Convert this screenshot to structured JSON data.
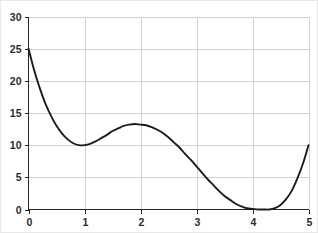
{
  "chart_data": {
    "type": "line",
    "title": "",
    "subtitle": "",
    "xlabel": "",
    "ylabel": "",
    "xlim": [
      0,
      5
    ],
    "ylim": [
      0,
      30
    ],
    "grid": true,
    "legend": null,
    "legend_position": "none",
    "xticks": [
      0,
      1,
      2,
      3,
      4,
      5
    ],
    "xtick_labels": [
      "0",
      "1",
      "2",
      "3",
      "4",
      "5"
    ],
    "yticks": [
      0,
      5,
      10,
      15,
      20,
      25,
      30
    ],
    "ytick_labels": [
      "0",
      "5",
      "10",
      "15",
      "20",
      "25",
      "30"
    ],
    "series": [
      {
        "name": "curve",
        "color": "#1c1c1c",
        "line_width": 1.9,
        "x": [
          0.0,
          0.1,
          0.2,
          0.3,
          0.4,
          0.5,
          0.6,
          0.7,
          0.8,
          0.9,
          1.0,
          1.1,
          1.2,
          1.3,
          1.4,
          1.5,
          1.6,
          1.7,
          1.8,
          1.9,
          2.0,
          2.1,
          2.2,
          2.3,
          2.4,
          2.5,
          2.6,
          2.7,
          2.8,
          2.9,
          3.0,
          3.1,
          3.2,
          3.3,
          3.4,
          3.5,
          3.6,
          3.7,
          3.8,
          3.9,
          4.0,
          4.1,
          4.2,
          4.3,
          4.4,
          4.5,
          4.6,
          4.7,
          4.8,
          4.9,
          5.0
        ],
        "y": [
          25.0,
          21.7,
          18.9,
          16.5,
          14.6,
          13.0,
          11.8,
          10.9,
          10.3,
          10.0,
          10.0,
          10.2,
          10.6,
          11.1,
          11.6,
          12.2,
          12.6,
          13.0,
          13.2,
          13.3,
          13.2,
          13.1,
          12.8,
          12.4,
          11.9,
          11.2,
          10.4,
          9.6,
          8.6,
          7.7,
          6.7,
          5.7,
          4.7,
          3.8,
          2.9,
          2.1,
          1.5,
          0.9,
          0.5,
          0.2,
          0.1,
          0.0,
          0.0,
          0.0,
          0.2,
          0.7,
          1.6,
          2.9,
          4.8,
          7.1,
          10.0
        ]
      }
    ],
    "annotations": {
      "key_points": [
        {
          "label": "start",
          "x": 0,
          "y": 25
        },
        {
          "label": "local-minimum",
          "x": 1.0,
          "y": 10.0
        },
        {
          "label": "local-maximum",
          "x": 2.25,
          "y": 13.25
        },
        {
          "label": "global-minimum",
          "x": 4.25,
          "y": 0.0
        },
        {
          "label": "end",
          "x": 5.0,
          "y": 10.0
        }
      ]
    },
    "colors": {
      "curve": "#1c1c1c",
      "grid": "#d2d2d2",
      "axis": "#262626",
      "text": "#2b2b2b",
      "background": "#ffffff"
    }
  }
}
